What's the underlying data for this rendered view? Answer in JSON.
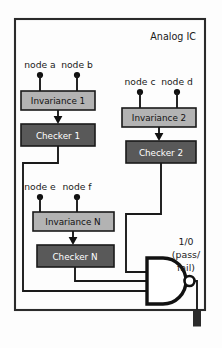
{
  "diagram": {
    "title": "Analog IC",
    "background_color": "#fdfdfd",
    "border_color": "#2b2b2b",
    "colors": {
      "invariance_fill": "#b3b3b3",
      "checker_fill": "#595959",
      "wire": "#1a1a1a",
      "gate": "#111111",
      "text_dark": "#1a1a1a",
      "text_light": "#ffffff"
    },
    "nodes": {
      "group_1": {
        "left_label": "node a",
        "right_label": "node b"
      },
      "group_2": {
        "left_label": "node c",
        "right_label": "node d"
      },
      "group_n": {
        "left_label": "node e",
        "right_label": "node f"
      }
    },
    "blocks": {
      "invariance_1": "Invariance 1",
      "checker_1": "Checker 1",
      "invariance_2": "Invariance 2",
      "checker_2": "Checker 2",
      "invariance_n": "Invariance N",
      "checker_n": "Checker N"
    },
    "output": {
      "gate_type": "NAND",
      "line_1": "1/0",
      "line_2": "(pass/",
      "line_3": "fail)"
    }
  }
}
